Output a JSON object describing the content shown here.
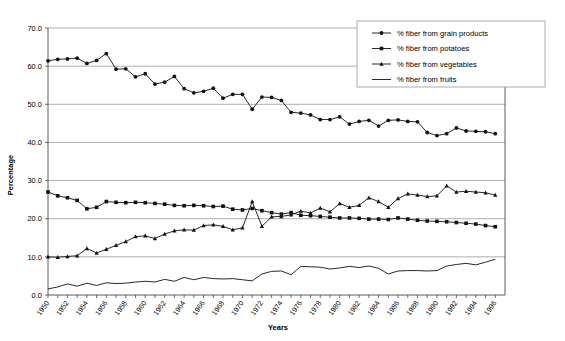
{
  "chart_data": {
    "type": "line",
    "title": "",
    "xlabel": "Years",
    "ylabel": "Percentage",
    "xlim": [
      1950,
      1997
    ],
    "ylim": [
      0,
      70
    ],
    "ytick_step": 10,
    "ytick_labels": [
      "0.0",
      "10.0",
      "20.0",
      "30.0",
      "40.0",
      "50.0",
      "60.0",
      "70.0"
    ],
    "ytick_values": [
      0,
      10,
      20,
      30,
      40,
      50,
      60,
      70
    ],
    "grid": "horizontal",
    "legend_position": "top-right",
    "x": [
      1950,
      1951,
      1952,
      1953,
      1954,
      1955,
      1956,
      1957,
      1958,
      1959,
      1960,
      1961,
      1962,
      1963,
      1964,
      1965,
      1966,
      1967,
      1968,
      1969,
      1970,
      1971,
      1972,
      1973,
      1974,
      1975,
      1976,
      1977,
      1978,
      1979,
      1980,
      1981,
      1982,
      1983,
      1984,
      1985,
      1986,
      1987,
      1988,
      1989,
      1990,
      1991,
      1992,
      1993,
      1994,
      1995,
      1996
    ],
    "xtick_labels": [
      "1950",
      "1952",
      "1954",
      "1956",
      "1958",
      "1960",
      "1962",
      "1964",
      "1966",
      "1968",
      "1970",
      "1972",
      "1974",
      "1976",
      "1978",
      "1980",
      "1982",
      "1984",
      "1986",
      "1988",
      "1990",
      "1992",
      "1994",
      "1996"
    ],
    "xtick_values": [
      1950,
      1952,
      1954,
      1956,
      1958,
      1960,
      1962,
      1964,
      1966,
      1968,
      1970,
      1972,
      1974,
      1976,
      1978,
      1980,
      1982,
      1984,
      1986,
      1988,
      1990,
      1992,
      1994,
      1996
    ],
    "series": [
      {
        "name": "% fiber from grain products",
        "marker": "diamond",
        "values": [
          61.4,
          61.8,
          61.9,
          62.1,
          60.7,
          61.5,
          63.3,
          59.2,
          59.3,
          57.2,
          58.0,
          55.3,
          55.8,
          57.3,
          54.1,
          53.0,
          53.4,
          54.2,
          51.6,
          52.6,
          52.6,
          48.7,
          51.9,
          51.8,
          51.0,
          47.9,
          47.7,
          47.2,
          46.0,
          46.0,
          46.7,
          44.8,
          45.5,
          45.8,
          44.3,
          45.8,
          45.9,
          45.5,
          45.4,
          42.6,
          41.8,
          42.3,
          43.8,
          43.0,
          42.9,
          42.8,
          42.3
        ]
      },
      {
        "name": "% fiber from potatoes",
        "marker": "square",
        "values": [
          27.0,
          26.0,
          25.5,
          24.8,
          22.6,
          23.0,
          24.5,
          24.3,
          24.2,
          24.3,
          24.2,
          24.0,
          23.8,
          23.5,
          23.4,
          23.5,
          23.4,
          23.2,
          23.3,
          22.5,
          22.3,
          22.7,
          22.1,
          21.6,
          21.2,
          21.6,
          20.9,
          20.8,
          20.6,
          20.4,
          20.2,
          20.2,
          20.1,
          19.9,
          19.9,
          19.8,
          20.2,
          19.9,
          19.6,
          19.4,
          19.3,
          19.2,
          19.0,
          18.8,
          18.6,
          18.2,
          17.9
        ]
      },
      {
        "name": "% fiber from vegetables",
        "marker": "triangle",
        "values": [
          10.0,
          9.9,
          10.1,
          10.3,
          12.2,
          11.0,
          12.0,
          13.0,
          14.0,
          15.3,
          15.5,
          14.8,
          16.0,
          16.8,
          17.1,
          17.0,
          18.2,
          18.4,
          18.0,
          17.1,
          17.6,
          24.5,
          18.0,
          20.5,
          20.6,
          21.0,
          22.0,
          21.5,
          22.8,
          21.8,
          24.0,
          23.0,
          23.5,
          25.5,
          24.5,
          23.0,
          25.3,
          26.5,
          26.2,
          25.8,
          26.0,
          28.6,
          27.0,
          27.2,
          27.0,
          26.8,
          26.2
        ]
      },
      {
        "name": "% fiber from fruits",
        "marker": "none",
        "values": [
          1.6,
          2.1,
          2.9,
          2.3,
          3.1,
          2.5,
          3.2,
          3.0,
          3.1,
          3.4,
          3.6,
          3.4,
          4.1,
          3.6,
          4.6,
          4.0,
          4.6,
          4.3,
          4.2,
          4.3,
          4.0,
          3.7,
          5.5,
          6.2,
          6.3,
          5.3,
          7.5,
          7.4,
          7.3,
          6.8,
          7.1,
          7.5,
          7.2,
          7.6,
          7.0,
          5.5,
          6.3,
          6.4,
          6.4,
          6.3,
          6.4,
          7.6,
          8.0,
          8.3,
          7.9,
          8.6,
          9.4
        ]
      }
    ]
  }
}
